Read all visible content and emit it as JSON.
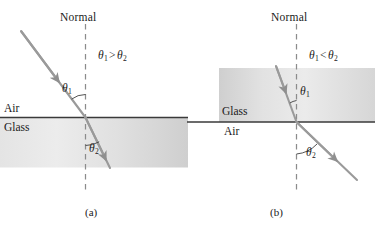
{
  "figure": {
    "kind": "refraction-diagram",
    "colors": {
      "ray": "#9a9a9a",
      "normal_dash": "#8c8c8c",
      "interface_line": "#3a3a3a",
      "glass_fill_light": "#e9e9e9",
      "glass_fill_dark": "#cfcfcf",
      "text": "#1a1a1a"
    }
  },
  "panel_a": {
    "caption": "(a)",
    "normal_label": "Normal",
    "inequality": {
      "theta1": "θ",
      "sub1": "1",
      "op": ">",
      "theta2": "θ",
      "sub2": "2"
    },
    "medium_upper": "Air",
    "medium_lower": "Glass",
    "angle_incidence": {
      "symbol": "θ",
      "sub": "1"
    },
    "angle_refraction": {
      "symbol": "θ",
      "sub": "2"
    },
    "description": "Ray travels from air into glass, bending toward the normal"
  },
  "panel_b": {
    "caption": "(b)",
    "normal_label": "Normal",
    "inequality": {
      "theta1": "θ",
      "sub1": "1",
      "op": "<",
      "theta2": "θ",
      "sub2": "2"
    },
    "medium_upper": "Glass",
    "medium_lower": "Air",
    "angle_incidence": {
      "symbol": "θ",
      "sub": "1"
    },
    "angle_refraction": {
      "symbol": "θ",
      "sub": "2"
    },
    "description": "Ray travels from glass into air, bending away from the normal"
  }
}
